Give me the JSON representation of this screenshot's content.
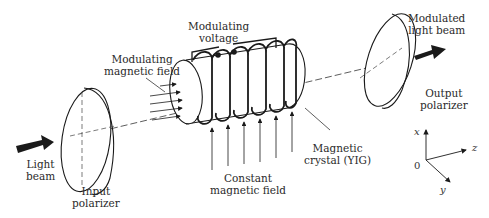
{
  "diagram": {
    "labels": {
      "modulating_voltage": [
        "Modulating",
        "voltage"
      ],
      "modulating_magnetic_field": [
        "Modulating",
        "magnetic field"
      ],
      "modulated_light_beam": [
        "Modulated",
        "light beam"
      ],
      "output_polarizer": [
        "Output",
        "polarizer"
      ],
      "light_beam": [
        "Light",
        "beam"
      ],
      "input_polarizer": [
        "Input",
        "polarizer"
      ],
      "constant_magnetic_field": [
        "Constant",
        "magnetic field"
      ],
      "magnetic_crystal": [
        "Magnetic",
        "crystal (YIG)"
      ]
    },
    "axes": {
      "x": "x",
      "y": "y",
      "z": "z",
      "origin": "0"
    },
    "colors": {
      "line": "#1a1a1a",
      "text": "#2a2a2a",
      "background": "#ffffff"
    }
  }
}
